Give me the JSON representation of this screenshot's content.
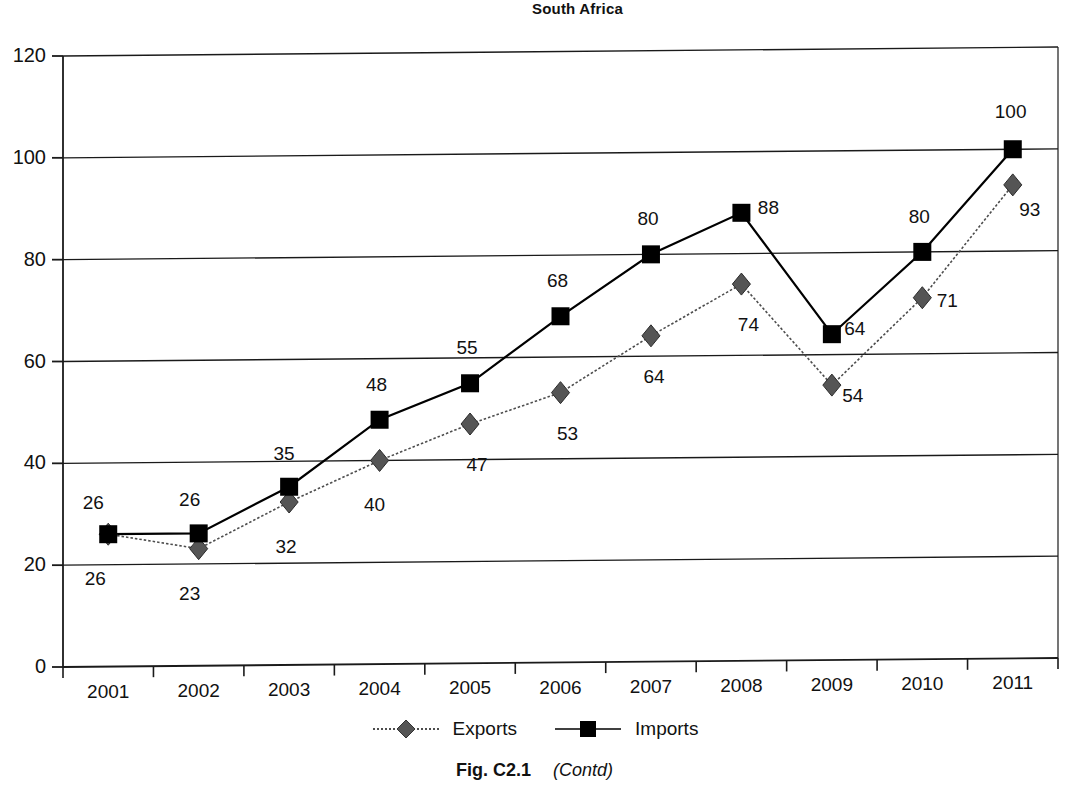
{
  "chart_data": {
    "type": "line",
    "title": "South Africa",
    "xlabel": "",
    "ylabel": "",
    "ylim": [
      0,
      120
    ],
    "yticks": [
      0,
      20,
      40,
      60,
      80,
      100,
      120
    ],
    "grid": true,
    "legend_position": "bottom",
    "categories": [
      "2001",
      "2002",
      "2003",
      "2004",
      "2005",
      "2006",
      "2007",
      "2008",
      "2009",
      "2010",
      "2011"
    ],
    "series": [
      {
        "name": "Exports",
        "marker": "diamond",
        "line": "dotted",
        "color": "#4d4d4d",
        "values": [
          26,
          23,
          32,
          40,
          47,
          53,
          64,
          74,
          54,
          71,
          93
        ]
      },
      {
        "name": "Imports",
        "marker": "square",
        "line": "solid",
        "color": "#000000",
        "values": [
          26,
          26,
          35,
          48,
          55,
          68,
          80,
          88,
          64,
          80,
          100
        ]
      }
    ]
  },
  "caption": {
    "figure_number": "Fig. C2.1",
    "contd": "(Contd)"
  },
  "legend": {
    "exports_label": "Exports",
    "imports_label": "Imports"
  }
}
